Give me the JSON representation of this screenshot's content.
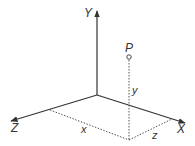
{
  "diagram": {
    "type": "3d-coordinate-axes",
    "axes": {
      "x": {
        "label": "X"
      },
      "y": {
        "label": "Y"
      },
      "z": {
        "label": "Z"
      }
    },
    "point": {
      "label": "P"
    },
    "components": {
      "x": "x",
      "y": "y",
      "z": "z"
    },
    "colors": {
      "axis": "#333333",
      "dashed": "#555555"
    }
  }
}
